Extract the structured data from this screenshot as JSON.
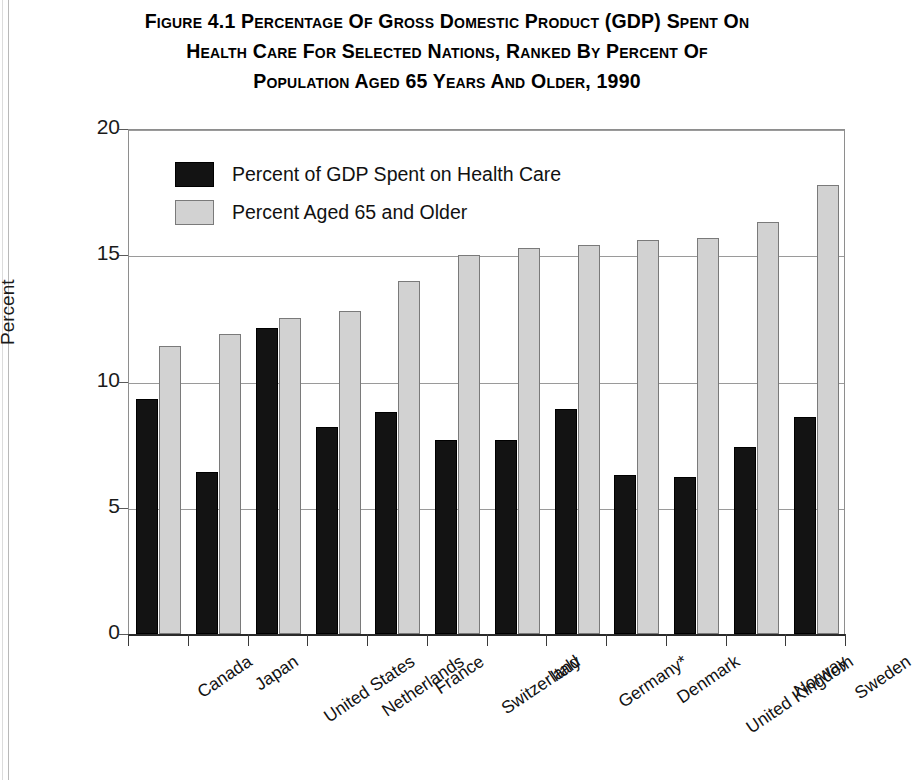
{
  "figure": {
    "title_lines": [
      "Figure 4.1  Percentage of Gross Domestic Product (GDP) Spent on",
      "Health Care for Selected Nations, Ranked by Percent of",
      "Population Aged 65 Years and Older, 1990"
    ]
  },
  "chart_data": {
    "type": "bar",
    "title": "Figure 4.1  Percentage of Gross Domestic Product (GDP) Spent on Health Care for Selected Nations, Ranked by Percent of Population Aged 65 Years and Older, 1990",
    "xlabel": "",
    "ylabel": "Percent",
    "ylim": [
      0,
      20
    ],
    "yticks": [
      "0",
      "5",
      "10",
      "15",
      "20"
    ],
    "ytick_values": [
      0,
      5,
      10,
      15,
      20
    ],
    "grid": "horizontal",
    "legend_position": "upper-left inside plot",
    "categories": [
      "Canada",
      "Japan",
      "United States",
      "Netherlands",
      "France",
      "Switzerland",
      "Italy",
      "Germany*",
      "Denmark",
      "United Kingdom",
      "Norway",
      "Sweden"
    ],
    "series": [
      {
        "name": "Percent of GDP Spent on Health Care",
        "color": "#131313",
        "values": [
          9.3,
          6.4,
          12.1,
          8.2,
          8.8,
          7.7,
          7.7,
          8.9,
          6.3,
          6.2,
          7.4,
          8.6
        ]
      },
      {
        "name": "Percent Aged 65 and Older",
        "color": "#d2d2d2",
        "values": [
          11.4,
          11.9,
          12.5,
          12.8,
          14.0,
          15.0,
          15.3,
          15.4,
          15.6,
          15.7,
          16.3,
          17.8
        ]
      }
    ]
  }
}
